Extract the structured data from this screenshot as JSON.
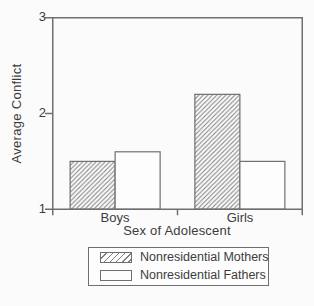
{
  "chart_data": {
    "type": "bar",
    "title": "",
    "categories": [
      "Boys",
      "Girls"
    ],
    "series": [
      {
        "name": "Nonresidential Mothers",
        "style": "hatched",
        "values": [
          1.5,
          2.2
        ]
      },
      {
        "name": "Nonresidential Fathers",
        "style": "open",
        "values": [
          1.6,
          1.5
        ]
      }
    ],
    "xlabel": "Sex of Adolescent",
    "ylabel": "Average Conflict",
    "ylim": [
      1,
      3
    ],
    "yticks": [
      1,
      2,
      3
    ],
    "ytick_labels": [
      "1",
      "2",
      "3"
    ],
    "grid": false,
    "legend_position": "bottom",
    "colors": {
      "line": "#6f6f6f",
      "hatch": "#808080",
      "text": "#3c3c3c",
      "bar_fill": "#fdfdfd",
      "background": "#fbfbfb"
    }
  }
}
